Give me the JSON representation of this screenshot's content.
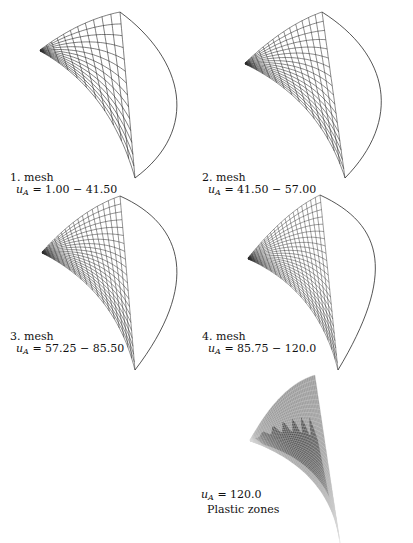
{
  "figure": {
    "panels": [
      {
        "id": 1,
        "title": "1. mesh",
        "variable": "u",
        "subscript": "A",
        "range": "= 1.00 − 41.50"
      },
      {
        "id": 2,
        "title": "2. mesh",
        "variable": "u",
        "subscript": "A",
        "range": "= 41.50 − 57.00"
      },
      {
        "id": 3,
        "title": "3. mesh",
        "variable": "u",
        "subscript": "A",
        "range": "= 57.25 − 85.50"
      },
      {
        "id": 4,
        "title": "4. mesh",
        "variable": "u",
        "subscript": "A",
        "range": "= 85.75 − 120.0"
      },
      {
        "id": 5,
        "title": "Plastic zones",
        "variable": "u",
        "subscript": "A",
        "range": "= 120.0"
      }
    ],
    "colors": {
      "mesh_line": "#2a2a2a",
      "surface_elastic": "#9a9a9a",
      "surface_plastic": "#4a4a4a",
      "plastic_grid": "#d8d8d8"
    }
  }
}
